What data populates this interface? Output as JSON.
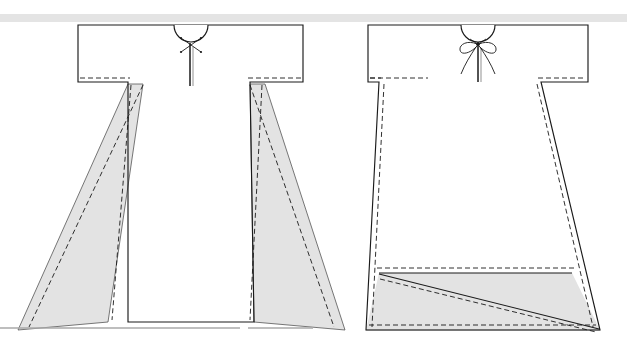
{
  "figure": {
    "kind": "technical-garment-illustration",
    "width": 627,
    "height": 346,
    "background_color": "#ffffff",
    "top_band": {
      "name": "top-divider-band",
      "color": "#e4e4e4",
      "x": 0,
      "y": 14,
      "width": 627,
      "height": 8
    },
    "styles": {
      "outline_color": "#1a1a1a",
      "outline_width": 1.1,
      "stitch_color": "#1a1a1a",
      "stitch_width": 0.9,
      "stitch_dash": "5,3",
      "panel_fill": "#e3e3e3",
      "panel_stroke": "#4a4a4a",
      "hem_line_color": "#9a9a9a"
    },
    "views": [
      {
        "id": "left-view",
        "name": "garment-front-view-with-side-gores",
        "label": "",
        "neck_detail": "x-stitch-tack",
        "bodice": {
          "left": 78,
          "top": 25,
          "right": 303,
          "bottom": 82
        },
        "hem_y": 330,
        "skirt_left_hem_x": 18,
        "skirt_right_hem_x": 345,
        "gore_panels": 2,
        "neck": {
          "center_x": 191,
          "opening_radius": 17,
          "slit_bottom_y": 85
        }
      },
      {
        "id": "right-view",
        "name": "garment-front-view-with-hem-band",
        "label": "",
        "neck_detail": "bow-tie-closure",
        "bodice": {
          "left": 368,
          "top": 25,
          "right": 588,
          "bottom": 82
        },
        "hem_y": 330,
        "skirt_left_hem_x": 366,
        "skirt_right_hem_x": 600,
        "band_top_y": 273,
        "band_diagonal": "top-left-to-bottom-right",
        "neck": {
          "center_x": 478,
          "opening_radius": 17,
          "slit_bottom_y": 82
        }
      }
    ]
  }
}
